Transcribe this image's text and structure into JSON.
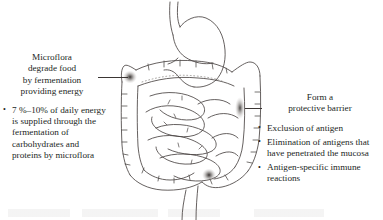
{
  "figure": {
    "background_color": "#ffffff",
    "text_color": "#231f1e",
    "line_color": "#4a4543"
  },
  "left_callout": {
    "heading": "Microflora\ndegrade food\nby fermentation\nproviding energy",
    "heading_lines": [
      "Microflora",
      "degrade food",
      "by fermentation",
      "providing energy"
    ],
    "bullets": [
      "7 %–10% of daily energy is supplied through the fermentation of carbohydrates and proteins by microflora"
    ],
    "leader_line": "leader-line-left"
  },
  "right_callout": {
    "heading_lines": [
      "Form a",
      "protective barrier"
    ],
    "bullets": [
      "Exclusion of antigen",
      "Elimination of antigens that have penetrated the mucosa",
      "Antigen-specific immune reactions"
    ],
    "leader_line": "leader-line-right"
  },
  "illustration": {
    "name": "digestive-tract-illustration",
    "organs": [
      "esophagus",
      "stomach",
      "duodenum",
      "transverse colon",
      "ascending colon",
      "descending colon",
      "small intestine",
      "cecum",
      "sigmoid colon",
      "rectum"
    ],
    "bacteria_markers": [
      {
        "name": "bacteria-marker-transverse-colon",
        "x": 130,
        "y": 77
      },
      {
        "name": "bacteria-marker-descending-colon",
        "x": 240,
        "y": 108
      },
      {
        "name": "bacteria-marker-cecum",
        "x": 209,
        "y": 175
      }
    ]
  }
}
